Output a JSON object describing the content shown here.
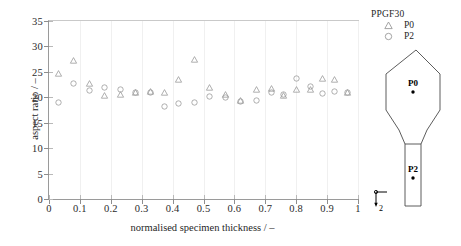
{
  "chart_data": {
    "type": "scatter",
    "title": "",
    "xlabel": "normalised specimen thickness / –",
    "ylabel": "aspect ratio / –",
    "xlim": [
      0,
      1
    ],
    "ylim": [
      0,
      35
    ],
    "xticks": [
      "0",
      "0.1",
      "0.2",
      "0.3",
      "0.4",
      "0.5",
      "0.6",
      "0.7",
      "0.8",
      "0.9",
      "1"
    ],
    "xtick_values": [
      0,
      0.1,
      0.2,
      0.3,
      0.4,
      0.5,
      0.6,
      0.7,
      0.8,
      0.9,
      1
    ],
    "yticks": [
      "0",
      "5",
      "10",
      "15",
      "20",
      "25",
      "30",
      "35"
    ],
    "ytick_values": [
      0,
      5,
      10,
      15,
      20,
      25,
      30,
      35
    ],
    "grid": "vertical-light",
    "legend_position": "right-top",
    "legend_title": "PPGF30",
    "series": [
      {
        "name": "P0",
        "marker": "triangle",
        "color": "#9a9a9a",
        "points": [
          [
            0.03,
            24.7
          ],
          [
            0.08,
            27.2
          ],
          [
            0.13,
            22.7
          ],
          [
            0.18,
            20.4
          ],
          [
            0.23,
            20.5
          ],
          [
            0.28,
            21.0
          ],
          [
            0.33,
            21.1
          ],
          [
            0.375,
            21.0
          ],
          [
            0.42,
            23.4
          ],
          [
            0.47,
            27.4
          ],
          [
            0.52,
            21.9
          ],
          [
            0.57,
            20.5
          ],
          [
            0.62,
            19.3
          ],
          [
            0.67,
            21.6
          ],
          [
            0.72,
            21.8
          ],
          [
            0.76,
            20.4
          ],
          [
            0.8,
            21.6
          ],
          [
            0.845,
            21.5
          ],
          [
            0.885,
            23.6
          ],
          [
            0.925,
            23.5
          ],
          [
            0.965,
            20.9
          ]
        ]
      },
      {
        "name": "P2",
        "marker": "circle",
        "color": "#9a9a9a",
        "points": [
          [
            0.03,
            19.0
          ],
          [
            0.08,
            22.8
          ],
          [
            0.13,
            21.4
          ],
          [
            0.18,
            22.0
          ],
          [
            0.23,
            21.5
          ],
          [
            0.28,
            21.0
          ],
          [
            0.33,
            20.9
          ],
          [
            0.375,
            18.2
          ],
          [
            0.42,
            18.8
          ],
          [
            0.47,
            18.9
          ],
          [
            0.52,
            20.1
          ],
          [
            0.57,
            19.9
          ],
          [
            0.62,
            19.1
          ],
          [
            0.67,
            19.3
          ],
          [
            0.72,
            21.0
          ],
          [
            0.76,
            20.6
          ],
          [
            0.8,
            23.7
          ],
          [
            0.845,
            22.2
          ],
          [
            0.885,
            20.8
          ],
          [
            0.925,
            21.1
          ],
          [
            0.965,
            20.9
          ]
        ]
      }
    ]
  },
  "legend": {
    "title": "PPGF30",
    "entries": [
      {
        "label": "P0",
        "marker": "triangle-icon"
      },
      {
        "label": "P2",
        "marker": "circle-icon"
      }
    ]
  },
  "specimen": {
    "point_labels": [
      "P0",
      "P2"
    ],
    "axis_marker": {
      "label_2": "2",
      "label_1": ""
    }
  }
}
